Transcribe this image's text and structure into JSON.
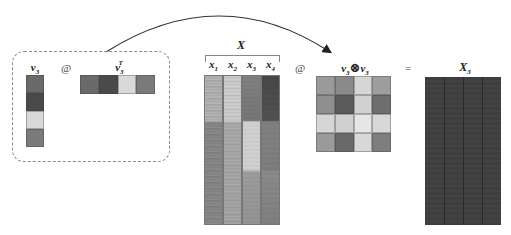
{
  "diagram": {
    "group_box": {
      "column_vector": {
        "label": "v",
        "sub": "3",
        "cells": [
          "#6a6a6a",
          "#4a4a4a",
          "#d9d9d9",
          "#7a7a7a"
        ]
      },
      "matmul_symbol": "@",
      "row_vector": {
        "label": "v",
        "sub": "3",
        "sup": "T",
        "cells": [
          "#6a6a6a",
          "#4a4a4a",
          "#d9d9d9",
          "#7a7a7a"
        ]
      }
    },
    "arrow": {
      "from": "group_box",
      "to": "outer_product"
    },
    "X_matrix": {
      "title": "X",
      "columns": [
        {
          "label": "x",
          "sub": "1",
          "base": "#c8c8c8"
        },
        {
          "label": "x",
          "sub": "2",
          "base": "#d4d4d4"
        },
        {
          "label": "x",
          "sub": "3",
          "base": "#8c8c8c"
        },
        {
          "label": "x",
          "sub": "4",
          "base": "#5a5a5a"
        }
      ]
    },
    "matmul_symbol_2": "@",
    "outer_product": {
      "label_left": "v",
      "label_left_sub": "3",
      "otimes": "⊗",
      "label_right": "v",
      "label_right_sub": "3",
      "grid": [
        [
          "#9a9a9a",
          "#8a8a8a",
          "#d6d6d6",
          "#9e9e9e"
        ],
        [
          "#8e8e8e",
          "#5a5a5a",
          "#d2d2d2",
          "#6e6e6e"
        ],
        [
          "#d6d6d6",
          "#d0d0d0",
          "#e6e6e6",
          "#d8d8d8"
        ],
        [
          "#9a9a9a",
          "#6a6a6a",
          "#d8d8d8",
          "#7e7e7e"
        ]
      ]
    },
    "equals_symbol": "=",
    "result": {
      "label": "X",
      "sub": "3",
      "color": "#3e3e3e"
    }
  }
}
